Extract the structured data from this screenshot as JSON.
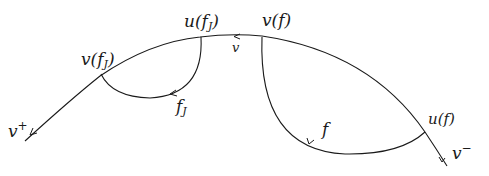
{
  "diagram": {
    "type": "hand-drawn path diagram",
    "stroke_color": "#1a1a1a",
    "background": "#ffffff",
    "main_curve": {
      "label_start": "v",
      "label_start_sup": "+",
      "label_end": "v",
      "label_end_sup": "−",
      "edge_label": "v"
    },
    "points": {
      "v_fJ": {
        "base": "v(f",
        "sub": "J",
        "close": ")"
      },
      "u_fJ": {
        "base": "u(f",
        "sub": "J",
        "close": ")"
      },
      "v_f": {
        "text": "v(f)"
      },
      "u_f": {
        "text": "u(f)"
      }
    },
    "arcs": {
      "fJ": {
        "base": "f",
        "sub": "J"
      },
      "f": {
        "text": "f"
      }
    }
  }
}
